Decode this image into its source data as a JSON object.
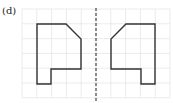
{
  "figure": {
    "label": "(d)",
    "grid": {
      "x0": 22,
      "y0": 9,
      "cell": 14.8,
      "cols": 10,
      "rows": 6,
      "color": "#e6e6e6"
    },
    "mirror_line": {
      "x": 96,
      "y1": 8,
      "y2": 101,
      "style": "dashed",
      "color": "#444444"
    },
    "shapes": [
      {
        "name": "original-shape",
        "points": [
          [
            37,
            24
          ],
          [
            66,
            24
          ],
          [
            81,
            39
          ],
          [
            81,
            69
          ],
          [
            51,
            69
          ],
          [
            51,
            84
          ],
          [
            37,
            84
          ]
        ],
        "stroke": "#333333"
      },
      {
        "name": "reflected-shape",
        "points": [
          [
            155,
            24
          ],
          [
            126,
            24
          ],
          [
            111,
            39
          ],
          [
            111,
            69
          ],
          [
            141,
            69
          ],
          [
            141,
            84
          ],
          [
            155,
            84
          ]
        ],
        "stroke": "#333333"
      }
    ]
  }
}
